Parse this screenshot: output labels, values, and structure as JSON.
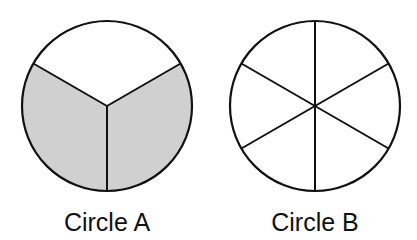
{
  "figure": {
    "circles": [
      {
        "label": "Circle A",
        "parts": 3,
        "shaded_parts": 2,
        "shade_color": "#d0d0d0",
        "description": "Circle divided into 3 equal parts, lower 2 parts shaded"
      },
      {
        "label": "Circle B",
        "parts": 6,
        "shaded_parts": 0,
        "description": "Circle divided into 6 equal parts, none shaded"
      }
    ]
  }
}
